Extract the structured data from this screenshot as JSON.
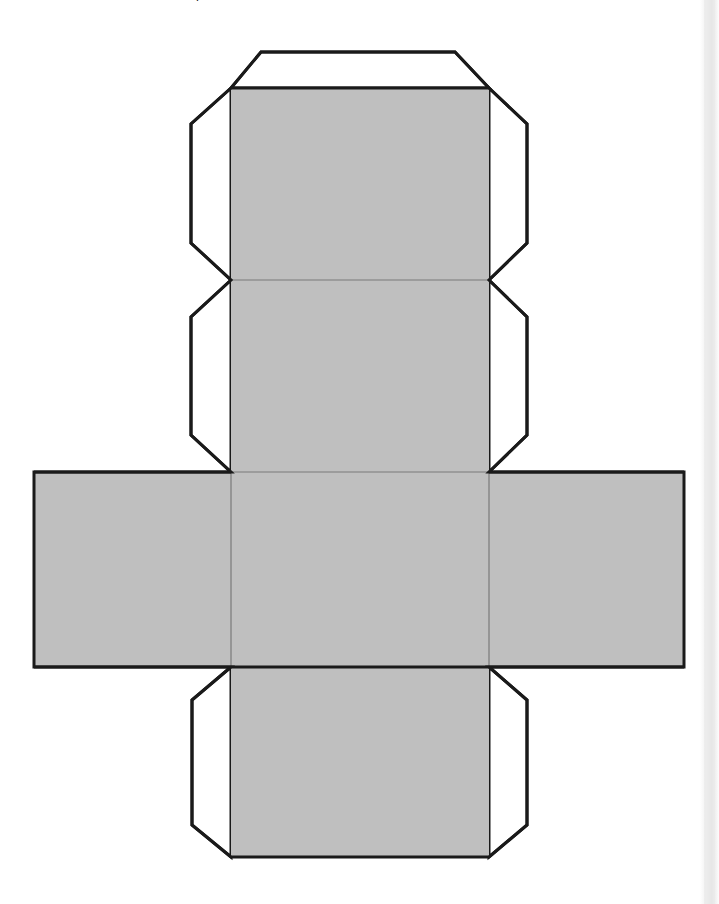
{
  "document": {
    "kind": "papercraft-template",
    "title_fragment": "p",
    "background_color": "#ffffff"
  },
  "style": {
    "face_fill": "#bfbfbf",
    "tab_fill": "#ffffff",
    "stroke_color": "#1a1a1a",
    "outer_stroke_width": 3,
    "fold_stroke_color": "#7a7a7a",
    "fold_stroke_width": 1.2
  },
  "scrollbar": {
    "present": true,
    "orientation": "vertical",
    "position": "right",
    "track_color": "#ececec",
    "thumb_color": "#e4e4e4",
    "left_px": 700,
    "width_px": 19
  },
  "net": {
    "type": "cube-net",
    "face_count": 6,
    "column_x_left": 231,
    "column_x_right": 489,
    "rows_y": [
      88,
      280,
      472,
      667,
      857
    ],
    "faces": [
      {
        "id": "face-top",
        "label": "top",
        "x": 231,
        "y": 88,
        "width": 258,
        "height": 192
      },
      {
        "id": "face-upper-middle",
        "label": "upper-middle",
        "x": 231,
        "y": 280,
        "width": 258,
        "height": 192
      },
      {
        "id": "face-center",
        "label": "center",
        "x": 231,
        "y": 472,
        "width": 258,
        "height": 195
      },
      {
        "id": "face-bottom",
        "label": "bottom",
        "x": 231,
        "y": 667,
        "width": 258,
        "height": 190
      },
      {
        "id": "face-left",
        "label": "left",
        "x": 34,
        "y": 472,
        "width": 197,
        "height": 195
      },
      {
        "id": "face-right",
        "label": "right",
        "x": 489,
        "y": 472,
        "width": 195,
        "height": 195
      }
    ],
    "flap": {
      "id": "flap-top",
      "label": "top-glue-flap",
      "points": "261,52 455,52 489,88 231,88"
    },
    "tabs": [
      {
        "id": "tab-left-row1",
        "label": "left-tab-row-1",
        "side": "left",
        "points": "231,88 191,124 191,243 231,280"
      },
      {
        "id": "tab-right-row1",
        "label": "right-tab-row-1",
        "side": "right",
        "points": "489,88 527,124 527,243 489,280"
      },
      {
        "id": "tab-left-row2",
        "label": "left-tab-row-2",
        "side": "left",
        "points": "231,280 191,317 191,435 231,472"
      },
      {
        "id": "tab-right-row2",
        "label": "right-tab-row-2",
        "side": "right",
        "points": "489,280 527,317 527,435 489,472"
      },
      {
        "id": "tab-left-row4",
        "label": "left-tab-row-4",
        "side": "left",
        "points": "231,667 192,700 192,825 231,857"
      },
      {
        "id": "tab-right-row4",
        "label": "right-tab-row-4",
        "side": "right",
        "points": "489,667 527,700 527,825 489,857"
      }
    ],
    "fold_lines": [
      {
        "id": "fold-row1-row2",
        "x1": 231,
        "y1": 280,
        "x2": 489,
        "y2": 280
      },
      {
        "id": "fold-row2-row3",
        "x1": 231,
        "y1": 472,
        "x2": 489,
        "y2": 472
      },
      {
        "id": "fold-row3-row4",
        "x1": 231,
        "y1": 667,
        "x2": 489,
        "y2": 667
      },
      {
        "id": "fold-left-center",
        "x1": 231,
        "y1": 472,
        "x2": 231,
        "y2": 667
      },
      {
        "id": "fold-right-center",
        "x1": 489,
        "y1": 472,
        "x2": 489,
        "y2": 667
      },
      {
        "id": "fold-flap-row1",
        "x1": 231,
        "y1": 88,
        "x2": 489,
        "y2": 88
      }
    ]
  }
}
